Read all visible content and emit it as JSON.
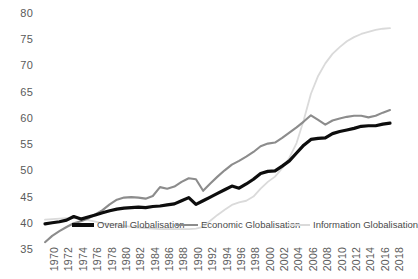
{
  "chart_data": {
    "type": "line",
    "title": "",
    "xlabel": "",
    "ylabel": "",
    "ylim": [
      35,
      80
    ],
    "ytick_values": [
      80,
      75,
      70,
      65,
      60,
      55,
      50,
      45,
      40,
      35
    ],
    "grid": false,
    "legend_position": "inside-bottom",
    "x": [
      1970,
      1971,
      1972,
      1973,
      1974,
      1975,
      1976,
      1977,
      1978,
      1979,
      1980,
      1981,
      1982,
      1983,
      1984,
      1985,
      1986,
      1987,
      1988,
      1989,
      1990,
      1991,
      1992,
      1993,
      1994,
      1995,
      1996,
      1997,
      1998,
      1999,
      2000,
      2001,
      2002,
      2003,
      2004,
      2005,
      2006,
      2007,
      2008,
      2009,
      2010,
      2011,
      2012,
      2013,
      2014,
      2015,
      2016,
      2017,
      2018
    ],
    "xtick_labels": [
      "1970",
      "1972",
      "1974",
      "1976",
      "1978",
      "1980",
      "1982",
      "1984",
      "1986",
      "1988",
      "1990",
      "1992",
      "1994",
      "1996",
      "1998",
      "2000",
      "2002",
      "2004",
      "2006",
      "2008",
      "2010",
      "2012",
      "2014",
      "2016",
      "2018"
    ],
    "series": [
      {
        "name": "Overall Globalisation",
        "color": "#0d0d0d",
        "width": 3.2,
        "values": [
          39.8,
          40.0,
          40.2,
          40.5,
          41.2,
          40.7,
          41.1,
          41.5,
          41.9,
          42.3,
          42.6,
          42.8,
          42.9,
          43.0,
          42.9,
          43.1,
          43.2,
          43.4,
          43.6,
          44.2,
          44.8,
          43.5,
          44.2,
          44.9,
          45.6,
          46.3,
          47.0,
          46.6,
          47.4,
          48.3,
          49.4,
          49.8,
          49.9,
          50.8,
          51.8,
          53.3,
          54.8,
          55.9,
          56.1,
          56.2,
          57.0,
          57.4,
          57.7,
          58.0,
          58.4,
          58.5,
          58.5,
          58.8,
          59.0
        ]
      },
      {
        "name": "Economic Globalisation",
        "color": "#8c8c8c",
        "width": 2.1,
        "values": [
          36.3,
          37.5,
          38.4,
          39.2,
          39.9,
          40.3,
          40.8,
          41.6,
          42.4,
          43.5,
          44.4,
          44.8,
          44.9,
          44.8,
          44.6,
          45.1,
          46.8,
          46.5,
          46.9,
          47.8,
          48.5,
          48.3,
          46.1,
          47.5,
          48.8,
          50.0,
          51.1,
          51.8,
          52.6,
          53.5,
          54.6,
          55.1,
          55.3,
          56.2,
          57.2,
          58.2,
          59.3,
          60.5,
          59.6,
          58.7,
          59.5,
          59.9,
          60.2,
          60.4,
          60.4,
          60.1,
          60.4,
          61.0,
          61.5
        ]
      },
      {
        "name": "Information Globalisation",
        "color": "#dadada",
        "width": 1.8,
        "values": [
          40.6,
          40.7,
          40.8,
          40.9,
          41.0,
          40.8,
          40.5,
          40.2,
          39.9,
          39.8,
          39.6,
          39.4,
          39.2,
          39.1,
          39.0,
          38.9,
          38.8,
          38.8,
          38.8,
          38.8,
          38.8,
          38.9,
          39.2,
          40.4,
          41.5,
          42.5,
          43.4,
          43.9,
          44.2,
          45.0,
          46.5,
          47.8,
          48.8,
          50.4,
          52.4,
          55.2,
          59.6,
          64.6,
          68.0,
          70.4,
          72.2,
          73.5,
          74.6,
          75.4,
          76.0,
          76.4,
          76.8,
          77.0,
          77.1
        ]
      }
    ]
  },
  "legend": {
    "items": [
      {
        "label": "Overall Globalisation"
      },
      {
        "label": "Economic Globalisation"
      },
      {
        "label": "Information Globalisation"
      }
    ]
  }
}
